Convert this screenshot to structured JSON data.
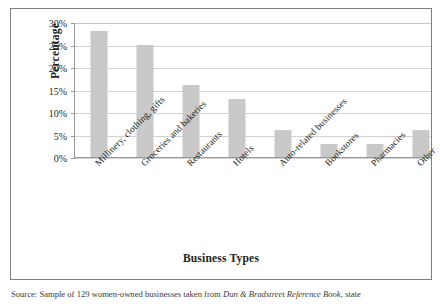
{
  "figure": {
    "source_note_prefix": "Source: Sample of 129 women-owned businesses taken from ",
    "source_note_booktitle": "Dun & Bradstreet Reference Book",
    "source_note_suffix": ", state"
  },
  "chart_data": {
    "type": "bar",
    "title": "",
    "xlabel": "Business Types",
    "ylabel": "Percentage",
    "categories": [
      "Millinery, clothing, gifts",
      "Groceries and bakeries",
      "Restaurants",
      "Hotels",
      "Auto-related businesses",
      "Bookstores",
      "Pharmacies",
      "Other"
    ],
    "values": [
      28,
      25,
      16,
      13,
      6,
      3,
      3,
      6
    ],
    "ylim": [
      0,
      30
    ],
    "yticks": [
      0,
      5,
      10,
      15,
      20,
      25,
      30
    ],
    "ytick_labels": [
      "0%",
      "5%",
      "10%",
      "15%",
      "20%",
      "25%",
      "30%"
    ],
    "grid": true,
    "legend": false,
    "bar_color": "#c9c9c9",
    "gridline_color": "#d2d2d2",
    "axis_color": "#9a9a9a"
  }
}
